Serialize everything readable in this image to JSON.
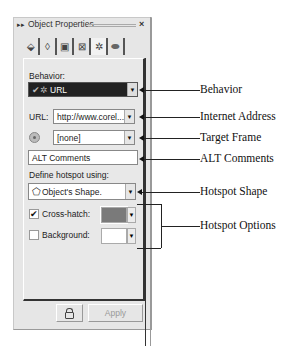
{
  "window": {
    "title": "Object Properties",
    "grip_icon": "double-chevron-right-icon",
    "close_label": "×"
  },
  "tabs": [
    {
      "icon": "fill-bucket-icon",
      "glyph": "⬙"
    },
    {
      "icon": "pen-nib-icon",
      "glyph": "◊"
    },
    {
      "icon": "frame-icon",
      "glyph": "▣"
    },
    {
      "icon": "transform-icon",
      "glyph": "⊠"
    },
    {
      "icon": "internet-link-icon",
      "glyph": "✲"
    },
    {
      "icon": "ellipse-shape-icon",
      "glyph": "⬬"
    }
  ],
  "form": {
    "behavior_label": "Behavior:",
    "behavior_value": "URL",
    "url_label": "URL:",
    "url_value": "http://www.corel...",
    "target_frame_value": "[none]",
    "alt_comments_value": "ALT Comments",
    "define_hotspot_label": "Define hotspot using:",
    "hotspot_shape_value": "Object's Shape.",
    "crosshatch_label": "Cross-hatch:",
    "crosshatch_checked": "✔",
    "crosshatch_color": "#7a7a7a",
    "background_label": "Background:",
    "background_checked": "",
    "background_color": "#ffffff",
    "dropdown_arrow": "▼"
  },
  "footer": {
    "lock_icon": "lock-icon",
    "apply_label": "Apply"
  },
  "callouts": [
    "Behavior",
    "Internet Address",
    "Target Frame",
    "ALT Comments",
    "Hotspot Shape",
    "Hotspot Options"
  ]
}
